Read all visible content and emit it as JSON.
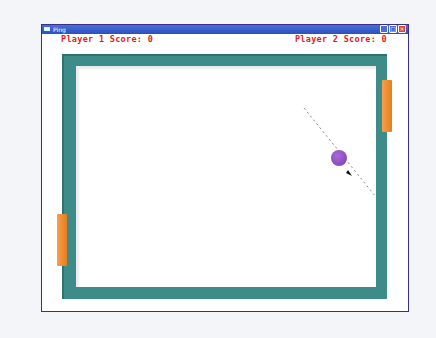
{
  "window": {
    "title": "Ping",
    "buttons": {
      "minimize": "_",
      "maximize": "□",
      "close": "×"
    }
  },
  "scores": {
    "player1": "Player 1 Score: 0",
    "player2": "Player 2 Score: 0"
  },
  "colors": {
    "score_text": "#e02020",
    "frame": "#3d8c89",
    "paddle": "#ee8a2a",
    "ball": "#8a4cc0",
    "titlebar": "#2a4fc0"
  }
}
